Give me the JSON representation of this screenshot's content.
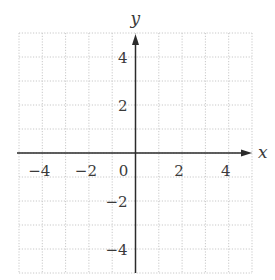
{
  "chart_data": {
    "type": "scatter",
    "title": "",
    "xlabel": "x",
    "ylabel": "y",
    "xlim": [
      -5,
      5
    ],
    "ylim": [
      -5,
      5
    ],
    "grid": true,
    "grid_step": 1,
    "x_ticks": [
      -4,
      -2,
      0,
      2,
      4
    ],
    "y_ticks": [
      4,
      2,
      -2,
      -4
    ],
    "x_tick_labels": [
      "−4",
      "−2",
      "0",
      "2",
      "4"
    ],
    "y_tick_labels": [
      "4",
      "2",
      "−2",
      "−4"
    ],
    "series": [],
    "legend": null
  },
  "colors": {
    "axis": "#2b2b2b",
    "grid": "#c8c8c8",
    "text": "#3a3a3a",
    "background": "#ffffff"
  }
}
